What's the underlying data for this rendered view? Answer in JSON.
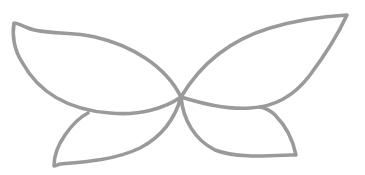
{
  "drawing": {
    "title": "Butterfly wings outline",
    "stroke_color": "#9a9a9a",
    "background": "#ffffff",
    "parts": [
      {
        "name": "upper-left-wing",
        "d": "M181,97 C165,65 130,45 95,37 C70,31 45,35 28,28 C22,26 18,23 14,23 C12,35 14,50 22,62 C40,95 70,110 110,113 C140,116 165,108 181,97 Z"
      },
      {
        "name": "upper-right-wing",
        "d": "M181,97 C200,65 230,40 270,28 C300,19 330,16 347,15 C340,30 325,55 310,75 C295,95 275,107 250,108 C225,110 200,103 181,97 Z"
      },
      {
        "name": "lower-left-wing",
        "d": "M181,97 C176,115 165,135 140,148 C115,160 85,162 60,164 C57,165 55,166 54,166 C54,155 58,145 65,135 C72,125 80,117 88,113"
      },
      {
        "name": "lower-right-wing",
        "d": "M181,97 C183,120 195,140 215,150 C235,158 265,156 290,155 C293,155 295,155 296,155 C293,140 285,125 275,115 C270,110 265,108 260,107"
      }
    ]
  }
}
